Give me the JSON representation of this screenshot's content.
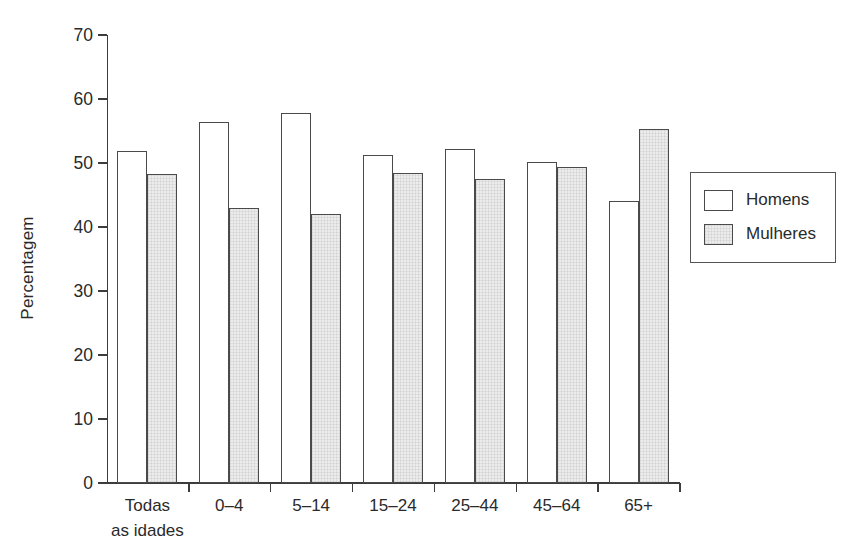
{
  "chart_data": {
    "type": "bar",
    "title": "",
    "subtitle": "",
    "xlabel": "",
    "ylabel": "Percentagem",
    "ylim": [
      0,
      70
    ],
    "yticks": [
      0,
      10,
      20,
      30,
      40,
      50,
      60,
      70
    ],
    "ytick_labels": [
      "0",
      "10",
      "20",
      "30",
      "40",
      "50",
      "60",
      "70"
    ],
    "grid": false,
    "legend_position": "right",
    "categories": [
      "Todas as idades",
      "0–4",
      "5–14",
      "15–24",
      "25–44",
      "45–64",
      "65+"
    ],
    "category_lines": [
      [
        "Todas",
        "as idades"
      ],
      [
        "0–4"
      ],
      [
        "5–14"
      ],
      [
        "15–24"
      ],
      [
        "25–44"
      ],
      [
        "45–64"
      ],
      [
        "65+"
      ]
    ],
    "series": [
      {
        "name": "Homens",
        "fill": "#ffffff",
        "values": [
          51.8,
          56.4,
          57.8,
          51.2,
          52.2,
          50.2,
          44.0
        ]
      },
      {
        "name": "Mulheres",
        "fill": "#ececec",
        "values": [
          48.3,
          43.0,
          42.0,
          48.4,
          47.5,
          49.3,
          55.3
        ]
      }
    ]
  },
  "legend": {
    "items": [
      {
        "label": "Homens"
      },
      {
        "label": "Mulheres"
      }
    ]
  },
  "colors": {
    "axis": "#3c3c3c",
    "bar_outline": "#4a4a4a",
    "men_fill": "#ffffff",
    "women_fill": "#ececec",
    "text": "#2a2a2a",
    "background": "#ffffff"
  }
}
